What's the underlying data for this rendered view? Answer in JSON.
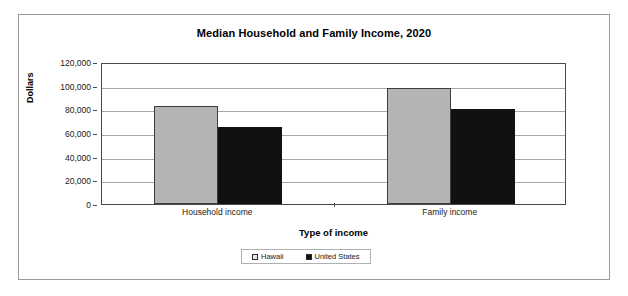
{
  "chart_data": {
    "type": "bar",
    "title": "Median Household and Family Income, 2020",
    "xlabel": "Type of income",
    "ylabel": "Dollars",
    "categories": [
      "Household income",
      "Family income"
    ],
    "series": [
      {
        "name": "Hawaii",
        "color": "#b4b4b4",
        "values": [
          83000,
          98000
        ]
      },
      {
        "name": "United States",
        "color": "#111111",
        "values": [
          65000,
          80000
        ]
      }
    ],
    "ylim": [
      0,
      120000
    ],
    "ytick_labels": [
      "0",
      "20,000",
      "40,000",
      "60,000",
      "80,000",
      "100,000",
      "120,000"
    ],
    "ytick_values": [
      0,
      20000,
      40000,
      60000,
      80000,
      100000,
      120000
    ],
    "grid": true,
    "legend_position": "bottom"
  }
}
